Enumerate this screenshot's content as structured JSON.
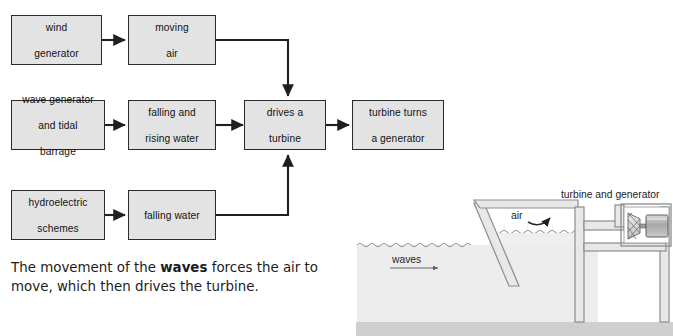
{
  "diagram": {
    "boxes": [
      {
        "id": "wind-generator",
        "label": "wind\ngenerator",
        "line1": "wind",
        "line2": "generator",
        "line3": ""
      },
      {
        "id": "moving-air",
        "label": "moving air",
        "line1": "moving",
        "line2": "air",
        "line3": ""
      },
      {
        "id": "wave-tidal",
        "label": "wave generator and tidal barrage",
        "line1": "wave generator",
        "line2": "and tidal",
        "line3": "barrage"
      },
      {
        "id": "falling-rising",
        "label": "falling and rising water",
        "line1": "falling and",
        "line2": "rising water",
        "line3": ""
      },
      {
        "id": "drives-turbine",
        "label": "drives a turbine",
        "line1": "drives a",
        "line2": "turbine",
        "line3": ""
      },
      {
        "id": "turbine-generator",
        "label": "turbine turns a generator",
        "line1": "turbine turns",
        "line2": "a generator",
        "line3": ""
      },
      {
        "id": "hydroelectric",
        "label": "hydroelectric schemes",
        "line1": "hydroelectric",
        "line2": "schemes",
        "line3": ""
      },
      {
        "id": "falling-water",
        "label": "falling water",
        "line1": "falling water",
        "line2": "",
        "line3": ""
      }
    ],
    "caption": {
      "part1": "The movement of the ",
      "bold": "waves",
      "part2": " forces the air to move, which then drives the turbine."
    }
  },
  "illustration": {
    "labels": {
      "turbine_and_generator": "turbine and generator",
      "air": "air",
      "waves": "waves"
    }
  },
  "colors": {
    "box_fill": "#e3e3e3",
    "box_border": "#2b2b2b",
    "arrow": "#1f1f1f",
    "water": "#ededed",
    "seabed": "#cfcfcf",
    "structure_fill": "#e8e8e8",
    "structure_stroke": "#8d8d8d",
    "generator_fill": "#b9b9b9",
    "page_bg": "#ffffff"
  }
}
